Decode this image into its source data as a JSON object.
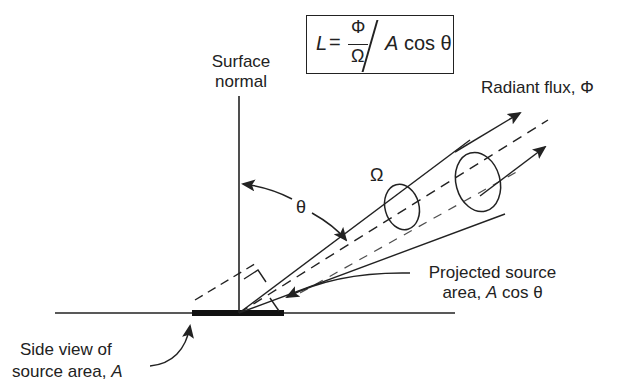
{
  "formula": {
    "lhs": "L",
    "equals": "=",
    "numerator": "Φ",
    "denominator": "Ω",
    "divider": "/",
    "rhs_var": "A",
    "rhs_rest": " cos θ"
  },
  "labels": {
    "surface_normal_line1": "Surface",
    "surface_normal_line2": "normal",
    "radiant_flux": "Radiant flux, Φ",
    "solid_angle": "Ω",
    "theta": "θ",
    "projected_line1": "Projected source",
    "projected_line2_prefix": "area, ",
    "projected_line2_var": "A",
    "projected_line2_suffix": " cos θ",
    "side_view_line1": "Side view of",
    "side_view_line2_prefix": "source area, ",
    "side_view_line2_var": "A"
  },
  "colors": {
    "ink": "#222222",
    "background": "#ffffff"
  }
}
